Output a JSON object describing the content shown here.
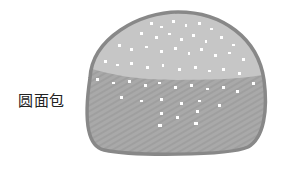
{
  "label": "圆面包",
  "illustration": {
    "subject": "round bread bun with sesame seeds",
    "colors": {
      "outline": "#888888",
      "top": "#c6c6c6",
      "bottom": "#a8a8a8",
      "seeds": "#ffffff"
    }
  }
}
